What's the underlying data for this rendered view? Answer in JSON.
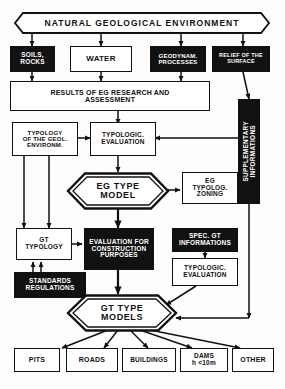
{
  "diagram": {
    "style": "hand-drawn black and white schematic",
    "nodes": {
      "banner": {
        "label": "NATURAL  GEOLOGICAL  ENVIRONMENT",
        "shape": "banner-hexagon",
        "fill": "white"
      },
      "soils_rocks": {
        "label": "SOILS,\nROCKS",
        "shape": "rect",
        "fill": "black"
      },
      "water": {
        "label": "WATER",
        "shape": "rect",
        "fill": "white"
      },
      "geodyn_processes": {
        "label": "GEODYNAM.\nPROCESSES",
        "shape": "rect",
        "fill": "black"
      },
      "relief_surface": {
        "label": "RELIEF OF THE\nSURFACE",
        "shape": "rect",
        "fill": "black"
      },
      "results_research": {
        "label": "RESULTS OF EG RESEARCH  AND\nASSESSMENT",
        "shape": "rect",
        "fill": "white"
      },
      "suppl_info": {
        "label": "SUPPLEMENTARY\nINFORMATIONS",
        "shape": "rect-vertical",
        "fill": "black"
      },
      "typology_geol_env": {
        "label": "TYPOLOGY\nOF THE GEOL.\nENVIRONM.",
        "shape": "rect",
        "fill": "white"
      },
      "typologic_evaluation_top": {
        "label": "TYPOLOGIC.\nEVALUATION",
        "shape": "rect",
        "fill": "white"
      },
      "eg_type_model": {
        "label": "EG TYPE\nMODEL",
        "shape": "hexagon",
        "fill": "white"
      },
      "eg_typolog_zoning": {
        "label": "EG\nTYPOLOG.\nZONING",
        "shape": "rect",
        "fill": "white"
      },
      "gt_typology": {
        "label": "GT\nTYPOLOGY",
        "shape": "rect",
        "fill": "white"
      },
      "evaluation_construction": {
        "label": "EVALUATION FOR\nCONSTRUCTION\nPURPOSES",
        "shape": "rect",
        "fill": "black"
      },
      "spec_gt_info": {
        "label": "SPEC. GT\nINFORMATIONS",
        "shape": "rect",
        "fill": "black"
      },
      "typologic_evaluation_bottom": {
        "label": "TYPOLOGIC.\nEVALUATION",
        "shape": "rect",
        "fill": "white"
      },
      "standards_regulations": {
        "label": "STANDARDS\nREGULATIONS",
        "shape": "rect",
        "fill": "black"
      },
      "gt_type_models": {
        "label": "GT TYPE\nMODELS",
        "shape": "hexagon",
        "fill": "white"
      },
      "out_pits": {
        "label": "PITS",
        "shape": "rect",
        "fill": "white"
      },
      "out_roads": {
        "label": "ROADS",
        "shape": "rect",
        "fill": "white"
      },
      "out_buildings": {
        "label": "BUILDINGS",
        "shape": "rect",
        "fill": "white"
      },
      "out_dams": {
        "label": "DAMS\nh <10m",
        "shape": "rect",
        "fill": "white"
      },
      "out_other": {
        "label": "OTHER",
        "shape": "rect",
        "fill": "white"
      }
    },
    "colors": {
      "ink": "#111111",
      "paper": "#fdfdfb",
      "fill_inverse": "#111111",
      "text_inverse": "#ffffff"
    }
  }
}
